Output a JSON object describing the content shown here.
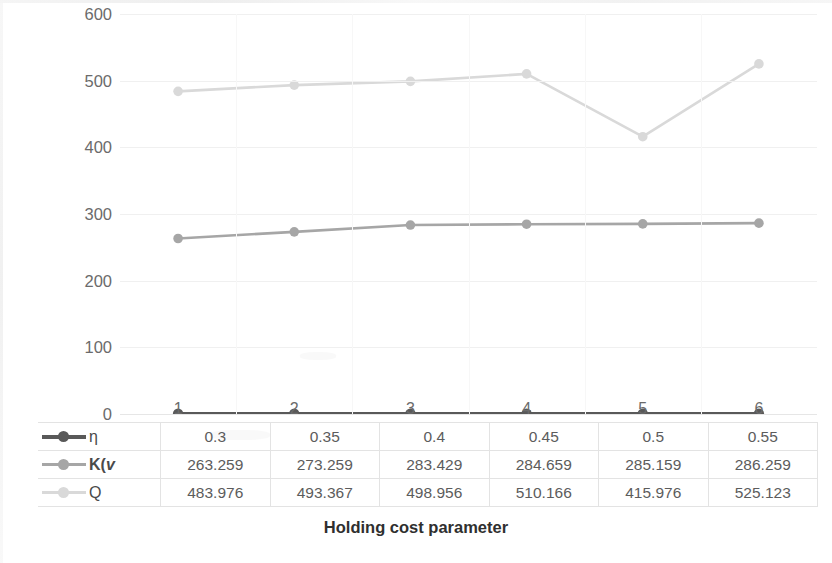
{
  "chart_data": {
    "type": "line",
    "title": "",
    "xlabel": "Holding cost parameter",
    "ylabel": "Values of K(v) & Q",
    "categories": [
      "1",
      "2",
      "3",
      "4",
      "5",
      "6"
    ],
    "ylim": [
      0,
      600
    ],
    "ytick_labels": [
      "0",
      "100",
      "200",
      "300",
      "400",
      "500",
      "600"
    ],
    "yticks": [
      0,
      100,
      200,
      300,
      400,
      500,
      600
    ],
    "grid": true,
    "legend_position": "data-table-below",
    "series": [
      {
        "name": "η",
        "color": "#595959",
        "values": [
          0.3,
          0.35,
          0.4,
          0.45,
          0.5,
          0.55
        ],
        "value_labels": [
          "0.3",
          "0.35",
          "0.4",
          "0.45",
          "0.5",
          "0.55"
        ]
      },
      {
        "name": "K(v",
        "color": "#a6a6a6",
        "values": [
          263.259,
          273.259,
          283.429,
          284.659,
          285.159,
          286.259
        ],
        "value_labels": [
          "263.259",
          "273.259",
          "283.429",
          "284.659",
          "285.159",
          "286.259"
        ]
      },
      {
        "name": "Q",
        "color": "#d9d9d9",
        "values": [
          483.976,
          493.367,
          498.956,
          510.166,
          415.976,
          525.123
        ],
        "value_labels": [
          "483.976",
          "493.367",
          "498.956",
          "510.166",
          "415.976",
          "525.123"
        ]
      }
    ]
  },
  "axis": {
    "y_title_prefix": "Values of ",
    "y_title_k": "K",
    "y_title_open": "(",
    "y_title_v": "v",
    "y_title_close": ")",
    "y_title_amp": " & ",
    "y_title_q": "Q",
    "x_title": "Holding cost parameter"
  },
  "legend_labels": {
    "eta": "η",
    "kv_bold": "K(",
    "kv_italic": "v",
    "q": "Q"
  },
  "colors": {
    "eta": "#595959",
    "kv": "#a6a6a6",
    "q": "#d9d9d9",
    "grid": "#f0f0f0",
    "table_border": "#e3e3e3",
    "text": "#5c5c5c",
    "background": "#ffffff"
  }
}
